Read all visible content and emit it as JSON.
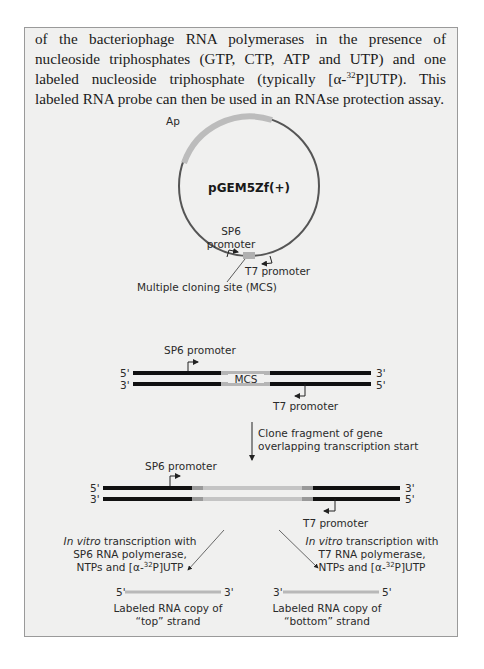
{
  "paragraph": {
    "line1": "of the bacteriophage RNA polymerases in the presence of nucleoside",
    "line2": "triphosphates (GTP, CTP, ATP and UTP) and one labeled nucleoside",
    "line3_pre": "triphosphate (typically [α-",
    "line3_sup": "32",
    "line3_post": "P]UTP). This labeled RNA probe can then be",
    "line4": "used in an RNAse protection assay."
  },
  "plasmid": {
    "name": "pGEM5Zf(+)",
    "ap_label": "Ap",
    "sp6_label_1": "SP6",
    "sp6_label_2": "promoter",
    "t7_label": "T7 promoter",
    "mcs_label": "Multiple cloning site (MCS)"
  },
  "duplex1": {
    "sp6_label": "SP6 promoter",
    "t7_label": "T7 promoter",
    "mcs_label": "MCS",
    "top_left": "5'",
    "top_right": "3'",
    "bottom_left": "3'",
    "bottom_right": "5'"
  },
  "step": {
    "line1": "Clone fragment of gene",
    "line2": "overlapping transcription start"
  },
  "duplex2": {
    "sp6_label": "SP6 promoter",
    "t7_label": "T7 promoter",
    "top_left": "5'",
    "top_right": "3'",
    "bottom_left": "3'",
    "bottom_right": "5'"
  },
  "left_branch": {
    "italic": "In vitro",
    "line1_rest": " transcription with",
    "line2": "SP6 RNA polymerase,",
    "line3_pre": "NTPs and [α-",
    "line3_sup": "32",
    "line3_post": "P]UTP",
    "end_left": "5'",
    "end_right": "3'",
    "caption1": "Labeled RNA copy of",
    "caption2": "“top” strand"
  },
  "right_branch": {
    "italic": "In vitro",
    "line1_rest": " transcription with",
    "line2": "T7 RNA polymerase,",
    "line3_pre": "NTPs and [α-",
    "line3_sup": "32",
    "line3_post": "P]UTP",
    "end_left": "3'",
    "end_right": "5'",
    "caption1": "Labeled RNA copy of",
    "caption2": "“bottom” strand"
  },
  "colors": {
    "box_bg": "#f0f0ef",
    "dna": "#111111",
    "insert": "#b5b5b5",
    "plasmid_ring": "#555555"
  }
}
